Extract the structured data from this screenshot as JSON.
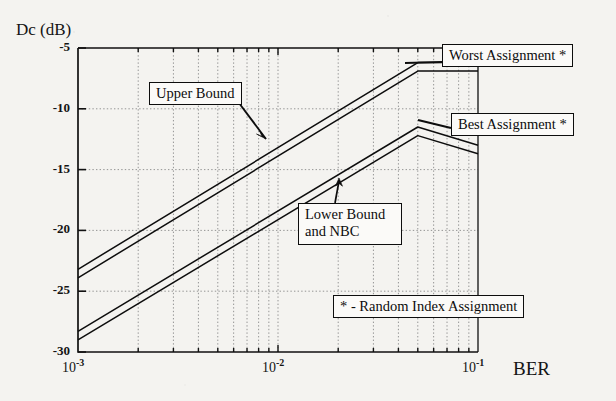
{
  "chart_data": {
    "type": "line",
    "title": "",
    "xlabel": "BER",
    "ylabel": "Dc (dB)",
    "xscale": "log",
    "xlim": [
      0.001,
      0.1
    ],
    "ylim": [
      -30,
      -5
    ],
    "yticks": [
      -5,
      -10,
      -15,
      -20,
      -25,
      -30
    ],
    "ytick_labels": [
      "-5",
      "-10",
      "-15",
      "-20",
      "-25",
      "-30"
    ],
    "xticks": [
      0.001,
      0.01,
      0.1
    ],
    "xtick_labels": [
      "10 -3",
      "10 -2",
      "10 -1"
    ],
    "xtick_mantissa": "10",
    "xtick_exponents": [
      "-3",
      "-2",
      "-1"
    ],
    "grid": true,
    "grid_style": "dotted",
    "legend_position": "none",
    "series": [
      {
        "name": "Worst Assignment * - Upper Bound",
        "x": [
          0.001,
          0.05,
          0.1
        ],
        "y": [
          -23.2,
          -6.2,
          -6.2
        ]
      },
      {
        "name": "Worst Assignment * - Lower Bound and NBC",
        "x": [
          0.001,
          0.05,
          0.1
        ],
        "y": [
          -23.9,
          -6.9,
          -6.9
        ]
      },
      {
        "name": "Best Assignment * - Upper Bound",
        "x": [
          0.001,
          0.05,
          0.1
        ],
        "y": [
          -28.3,
          -11.5,
          -13.0
        ]
      },
      {
        "name": "Best Assignment * - Lower Bound and NBC",
        "x": [
          0.001,
          0.05,
          0.1
        ],
        "y": [
          -29.0,
          -12.2,
          -13.7
        ]
      }
    ],
    "annotations": [
      {
        "id": "upper_bound",
        "text": "Upper Bound",
        "target_x": 0.0085,
        "target_y": -13.6
      },
      {
        "id": "worst_assignment",
        "text": "Worst Assignment *",
        "target_x": 0.044,
        "target_y": -6.6
      },
      {
        "id": "best_assignment",
        "text": "Best Assignment *",
        "target_x": 0.05,
        "target_y": -11.6
      },
      {
        "id": "lower_bound_nbc",
        "text": "Lower Bound and NBC",
        "target_x": 0.021,
        "target_y": -17.2
      },
      {
        "id": "footnote",
        "text": "* - Random Index Assignment"
      }
    ]
  },
  "axes": {
    "ylabel": "Dc (dB)",
    "xlabel": "BER",
    "ytick_labels": [
      "-5",
      "-10",
      "-15",
      "-20",
      "-25",
      "-30"
    ],
    "xtick_labels": [
      {
        "mantissa": "10",
        "exponent": "-3"
      },
      {
        "mantissa": "10",
        "exponent": "-2"
      },
      {
        "mantissa": "10",
        "exponent": "-1"
      }
    ]
  },
  "callouts": {
    "upper_bound": "Upper Bound",
    "worst_assignment": "Worst Assignment *",
    "best_assignment": "Best Assignment *",
    "lower_bound_line1": "Lower Bound",
    "lower_bound_line2": "and NBC",
    "footnote": "* - Random Index Assignment"
  },
  "colors": {
    "background": "#f4f3f0",
    "ink": "#0d0d0d",
    "grid": "#7a7a7a",
    "box_fill": "#fbfaf8"
  }
}
